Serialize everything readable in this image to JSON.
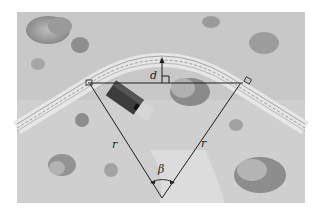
{
  "figure": {
    "labels": {
      "distance": "d",
      "radius_left": "r",
      "radius_right": "r",
      "angle": "β"
    },
    "colors": {
      "background": "#c9c9c9",
      "road": "#e8e8e8",
      "road_line": "#6a6a6a",
      "lines": "#1e1e1e",
      "shrub": "#8f8f8f",
      "shrub_light": "#b5b5b5",
      "house": "#3a3a3a"
    }
  }
}
